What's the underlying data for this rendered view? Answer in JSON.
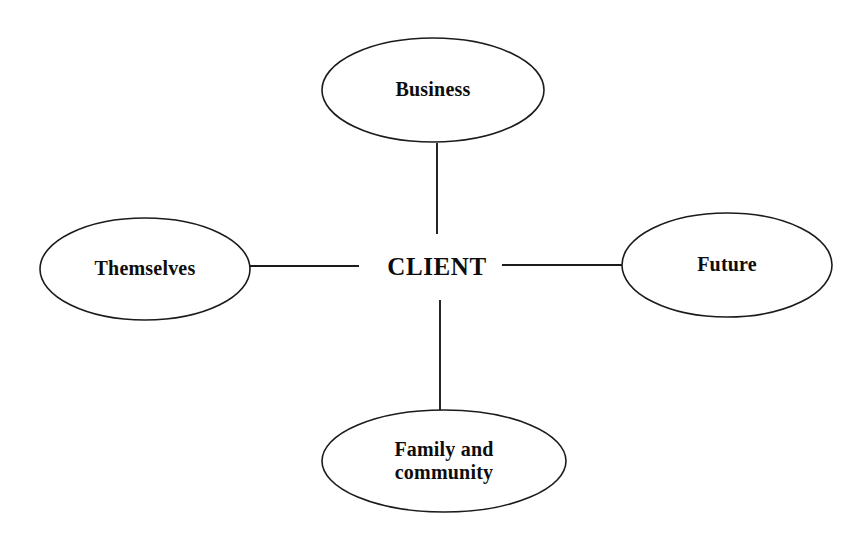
{
  "diagram": {
    "type": "radial-concept-map",
    "center_node": {
      "id": "client",
      "label": "CLIENT",
      "shape": "none",
      "cx": 437,
      "cy": 266
    },
    "satellite_nodes": [
      {
        "id": "business",
        "label": "Business",
        "position": "top",
        "shape": "ellipse",
        "cx": 433,
        "cy": 90,
        "rx": 111,
        "ry": 52
      },
      {
        "id": "themselves",
        "label": "Themselves",
        "position": "left",
        "shape": "ellipse",
        "cx": 145,
        "cy": 269,
        "rx": 105,
        "ry": 51
      },
      {
        "id": "future",
        "label": "Future",
        "position": "right",
        "shape": "ellipse",
        "cx": 727,
        "cy": 265,
        "rx": 105,
        "ry": 52
      },
      {
        "id": "family-and-community",
        "label": "Family and\ncommunity",
        "position": "bottom",
        "shape": "ellipse",
        "cx": 444,
        "cy": 461,
        "rx": 122,
        "ry": 51
      }
    ],
    "connectors": [
      {
        "id": "client-business",
        "from": "client",
        "to": "business",
        "x1": 437,
        "y1": 234,
        "x2": 437,
        "y2": 143
      },
      {
        "id": "client-themselves",
        "from": "client",
        "to": "themselves",
        "x1": 359,
        "y1": 266,
        "x2": 250,
        "y2": 266
      },
      {
        "id": "client-future",
        "from": "client",
        "to": "future",
        "x1": 502,
        "y1": 265,
        "x2": 622,
        "y2": 265
      },
      {
        "id": "client-family",
        "from": "client",
        "to": "family-and-community",
        "x1": 440,
        "y1": 300,
        "x2": 440,
        "y2": 411
      }
    ],
    "colors": {
      "background": "#ffffff",
      "stroke": "#1b1b1b",
      "node_fill": "#ffffff",
      "text": "#0d0d0d"
    }
  }
}
